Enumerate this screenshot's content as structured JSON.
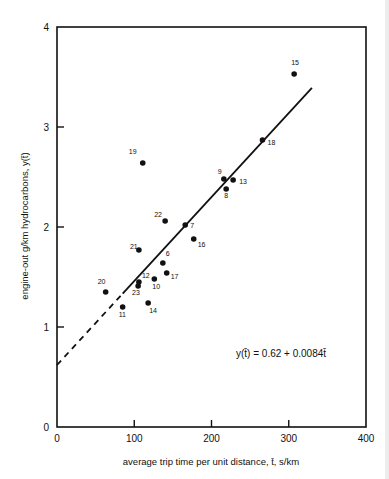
{
  "chart_data": {
    "type": "scatter",
    "title": "",
    "xlabel": "average trip time per unit distance, t̄, s/km",
    "ylabel": "engine-out g/km hydrocarbons, y(t̄)",
    "xlim": [
      0,
      400
    ],
    "ylim": [
      0,
      4
    ],
    "xticks": [
      0,
      100,
      200,
      300,
      400
    ],
    "yticks": [
      0,
      1,
      2,
      3,
      4
    ],
    "grid": false,
    "legend": null,
    "series": [
      {
        "name": "observations",
        "points": [
          {
            "id": "6",
            "t": 137,
            "y": 1.64
          },
          {
            "id": "7",
            "t": 166,
            "y": 2.02
          },
          {
            "id": "8",
            "t": 219,
            "y": 2.38
          },
          {
            "id": "9",
            "t": 216,
            "y": 2.48
          },
          {
            "id": "10",
            "t": 126,
            "y": 1.48
          },
          {
            "id": "11",
            "t": 85,
            "y": 1.2
          },
          {
            "id": "12",
            "t": 106,
            "y": 1.45
          },
          {
            "id": "13",
            "t": 228,
            "y": 2.47
          },
          {
            "id": "14",
            "t": 118,
            "y": 1.24
          },
          {
            "id": "15",
            "t": 307,
            "y": 3.53
          },
          {
            "id": "16",
            "t": 177,
            "y": 1.88
          },
          {
            "id": "17",
            "t": 142,
            "y": 1.54
          },
          {
            "id": "18",
            "t": 266,
            "y": 2.87
          },
          {
            "id": "19",
            "t": 111,
            "y": 2.64
          },
          {
            "id": "20",
            "t": 63,
            "y": 1.35
          },
          {
            "id": "21",
            "t": 106,
            "y": 1.77
          },
          {
            "id": "22",
            "t": 140,
            "y": 2.06
          },
          {
            "id": "23",
            "t": 105,
            "y": 1.41
          }
        ]
      },
      {
        "name": "regression fit",
        "type": "line",
        "intercept": 0.62,
        "slope": 0.0084,
        "dashed_range": [
          0,
          85
        ],
        "solid_range": [
          85,
          330
        ]
      }
    ],
    "annotations": [
      {
        "text": "y(t̄) = 0.62 + 0.0084t̄",
        "t": 225,
        "y": 0.73
      }
    ]
  },
  "labels": {
    "equation": "y(t̄)  =  0.62  +  0.0084t̄",
    "xlabel": "average trip time per unit distance,  t̄,  s/km",
    "ylabel": "engine-out g/km  hydrocarbons,  y(t̄)"
  },
  "style": {
    "ink": "#111111",
    "background": "#ffffff"
  }
}
